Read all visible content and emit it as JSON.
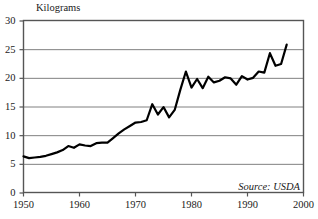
{
  "chart_data": {
    "type": "line",
    "title": "",
    "subtitle": "",
    "xlabel": "",
    "ylabel": "Kilograms",
    "ylabel_position": "top-left",
    "xlim": [
      1950,
      2000
    ],
    "ylim": [
      0,
      30
    ],
    "xticks": [
      1950,
      1960,
      1970,
      1980,
      1990,
      2000
    ],
    "yticks": [
      0,
      5,
      10,
      15,
      20,
      25,
      30
    ],
    "xtick_labels": [
      "1950",
      "1960",
      "1970",
      "1980",
      "1990",
      "2000"
    ],
    "ytick_labels": [
      "0",
      "5",
      "10",
      "15",
      "20",
      "25",
      "30"
    ],
    "grid": "horizontal",
    "grid_color": "#808080",
    "legend": "none",
    "line_color": "#000000",
    "line_width": 2.2,
    "annotations": [
      {
        "text": "Source: USDA",
        "position": "bottom-right",
        "style": "italic"
      }
    ],
    "series": [
      {
        "name": "Per capita consumption",
        "x": [
          1950,
          1951,
          1952,
          1953,
          1954,
          1955,
          1956,
          1957,
          1958,
          1959,
          1960,
          1961,
          1962,
          1963,
          1964,
          1965,
          1966,
          1967,
          1968,
          1969,
          1970,
          1971,
          1972,
          1973,
          1974,
          1975,
          1976,
          1977,
          1978,
          1979,
          1980,
          1981,
          1982,
          1983,
          1984,
          1985,
          1986,
          1987,
          1988,
          1989,
          1990,
          1991,
          1992,
          1993,
          1994,
          1995,
          1996,
          1997
        ],
        "values": [
          6.3,
          6.0,
          6.1,
          6.2,
          6.4,
          6.7,
          7.0,
          7.4,
          8.1,
          7.8,
          8.4,
          8.2,
          8.1,
          8.6,
          8.7,
          8.7,
          9.5,
          10.3,
          11.0,
          11.6,
          12.2,
          12.3,
          12.6,
          15.4,
          13.6,
          14.9,
          13.1,
          14.4,
          17.9,
          21.1,
          18.3,
          19.8,
          18.2,
          20.2,
          19.2,
          19.5,
          20.1,
          19.9,
          18.8,
          20.3,
          19.7,
          20.0,
          21.1,
          20.9,
          24.3,
          22.1,
          22.4,
          25.8
        ]
      }
    ]
  },
  "figure": {
    "background_color": "#ffffff",
    "axis_color": "#555555"
  }
}
